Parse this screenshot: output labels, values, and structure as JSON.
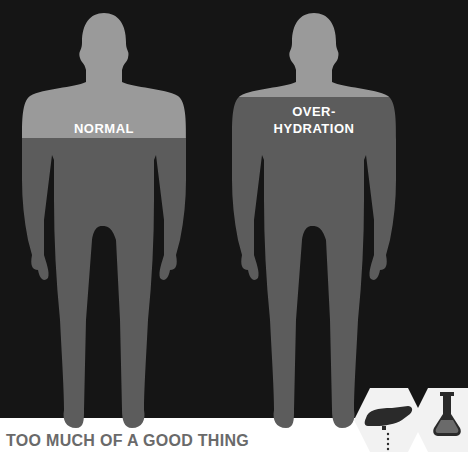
{
  "figures": [
    {
      "label_lines": [
        "NORMAL"
      ],
      "water_level_y": 138,
      "state": "normal"
    },
    {
      "label_lines": [
        "OVER-",
        "HYDRATION"
      ],
      "water_level_y": 97,
      "state": "over-hydration"
    }
  ],
  "headline": "TOO MUCH OF A GOOD THING",
  "icons": [
    {
      "name": "pouring-hand-icon"
    },
    {
      "name": "flask-icon"
    }
  ],
  "colors": {
    "background": "#151515",
    "body_dry": "#9a9a9a",
    "body_water": "#5c5c5c",
    "headline": "#6a6a6a",
    "icon_bg": "#f2f2f2"
  }
}
